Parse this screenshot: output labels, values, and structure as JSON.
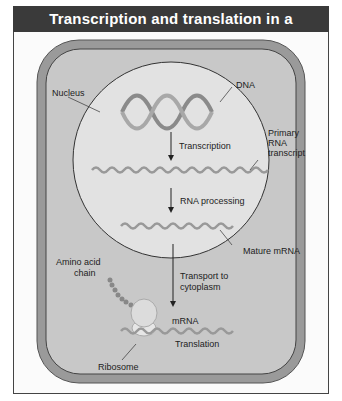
{
  "title": "Transcription and translation in a eukaryote",
  "labels": {
    "nucleus": "Nucleus",
    "dna": "DNA",
    "transcription": "Transcription",
    "primary_rna_1": "Primary",
    "primary_rna_2": "RNA",
    "primary_rna_3": "transcript",
    "rna_processing": "RNA processing",
    "mature_mrna": "Mature mRNA",
    "amino_acid_1": "Amino acid",
    "amino_acid_2": "chain",
    "transport_1": "Transport to",
    "transport_2": "cytoplasm",
    "mrna": "mRNA",
    "translation": "Translation",
    "ribosome": "Ribosome"
  },
  "colors": {
    "title_bar": "#3a3a3a",
    "cell_outer": "#9a9a9a",
    "cytoplasm": "#c8c8c8",
    "nucleus": "#e2e2e2"
  }
}
